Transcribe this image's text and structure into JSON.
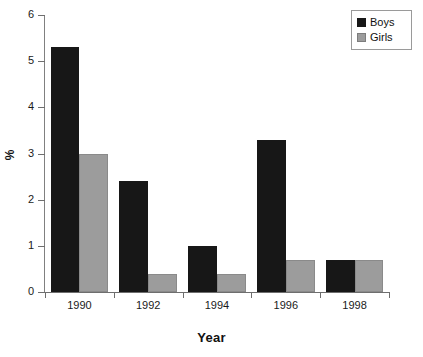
{
  "chart_data": {
    "type": "bar",
    "title": "",
    "subtitle": "",
    "xlabel": "Year",
    "ylabel": "%",
    "categories": [
      "1990",
      "1992",
      "1994",
      "1996",
      "1998"
    ],
    "series": [
      {
        "name": "Boys",
        "color": "#171717",
        "values": [
          5.3,
          2.4,
          1.0,
          3.3,
          0.7
        ]
      },
      {
        "name": "Girls",
        "color": "#9c9c9c",
        "values": [
          3.0,
          0.4,
          0.4,
          0.7,
          0.7
        ]
      }
    ],
    "ylim": [
      0,
      6
    ],
    "yticks": [
      0,
      1,
      2,
      3,
      4,
      5,
      6
    ],
    "ytick_labels": [
      "0",
      "1",
      "2",
      "3",
      "4",
      "5",
      "6"
    ],
    "xtick_labels": [
      "1990",
      "1992",
      "1994",
      "1996",
      "1998"
    ],
    "grid": false,
    "legend_position": "top-right",
    "legend_entries": [
      "Boys",
      "Girls"
    ]
  },
  "axes": {
    "y_title": "%",
    "x_title": "Year"
  },
  "legend": {
    "items": [
      {
        "label": "Boys",
        "swatch": "black-square-swatch"
      },
      {
        "label": "Girls",
        "swatch": "gray-square-swatch"
      }
    ]
  }
}
